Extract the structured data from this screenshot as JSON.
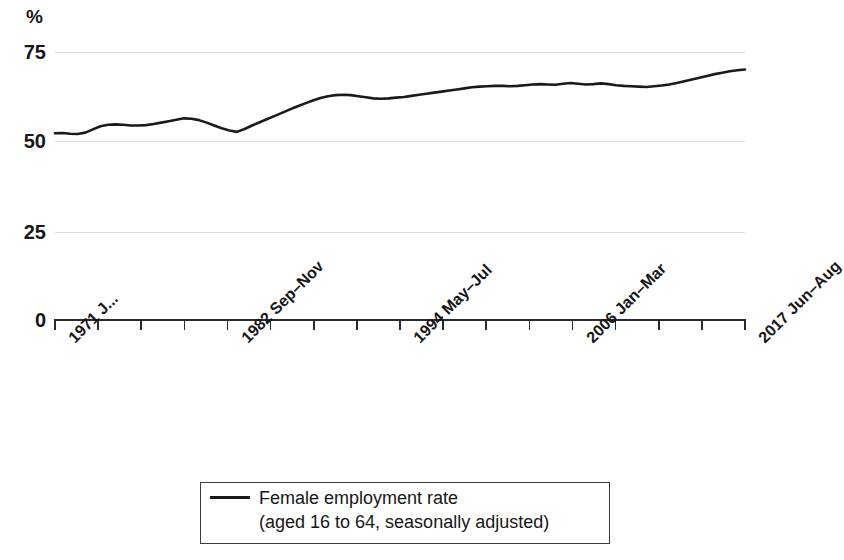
{
  "chart_data": {
    "type": "line",
    "title": "",
    "subtitle": "",
    "xlabel": "",
    "ylabel": "%",
    "ylim": [
      0,
      80
    ],
    "yticks": [
      0,
      25,
      50,
      75
    ],
    "ytick_labels": [
      "0",
      "25",
      "50",
      "75"
    ],
    "grid": true,
    "gridlines_at": [
      25,
      50,
      75
    ],
    "legend_position": "bottom-center",
    "axis_color": "#2a2a2a",
    "grid_color": "#dcdcdc",
    "series": [
      {
        "name": "Female employment rate",
        "name_detail": "(aged 16 to 64, seasonally adjusted)",
        "color": "#1a1a1a",
        "values": [
          52.2,
          52.3,
          52.1,
          52.0,
          52.4,
          53.3,
          54.2,
          54.6,
          54.7,
          54.6,
          54.4,
          54.4,
          54.5,
          54.8,
          55.2,
          55.6,
          56.0,
          56.4,
          56.3,
          55.9,
          55.2,
          54.4,
          53.6,
          53.0,
          52.6,
          53.4,
          54.4,
          55.3,
          56.2,
          57.1,
          58.0,
          58.9,
          59.8,
          60.6,
          61.4,
          62.1,
          62.6,
          62.9,
          63.0,
          62.9,
          62.6,
          62.3,
          62.0,
          61.9,
          62.0,
          62.2,
          62.4,
          62.7,
          63.0,
          63.3,
          63.6,
          63.9,
          64.2,
          64.5,
          64.8,
          65.1,
          65.3,
          65.4,
          65.5,
          65.5,
          65.4,
          65.5,
          65.7,
          65.9,
          66.0,
          65.9,
          65.8,
          66.1,
          66.3,
          66.1,
          65.9,
          66.0,
          66.2,
          66.0,
          65.7,
          65.5,
          65.4,
          65.3,
          65.2,
          65.4,
          65.6,
          65.9,
          66.3,
          66.8,
          67.3,
          67.8,
          68.3,
          68.8,
          69.2,
          69.6,
          69.9,
          70.1
        ]
      }
    ],
    "xtick_count": 17,
    "xtick_labels": [
      "1971 J...",
      "",
      "",
      "",
      "1982 Sep–Nov",
      "",
      "",
      "",
      "1994 May–Jul",
      "",
      "",
      "",
      "2006 Jan–Mar",
      "",
      "",
      "",
      "2017 Jun–Aug"
    ],
    "xtick_labels_visible": [
      "1971 J...",
      "1982 Sep–Nov",
      "1994 May–Jul",
      "2006 Jan–Mar",
      "2017 Jun–Aug"
    ]
  },
  "legend": {
    "series_label": "Female employment rate",
    "series_sublabel": "(aged 16 to 64, seasonally adjusted)"
  }
}
